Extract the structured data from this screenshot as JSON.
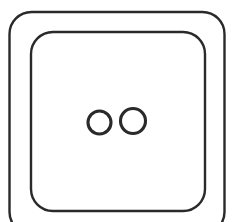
{
  "artwork": {
    "title": "Two-hole square button",
    "subject": "sewing-button",
    "style": "line-art-outline",
    "background_color": "#ffffff",
    "stroke_color": "#2a2a2a"
  },
  "canvas": {
    "width": 233,
    "height": 222
  },
  "shapes": {
    "outer_frame": {
      "name": "outer-rounded-square",
      "x": 9.5,
      "y": 12,
      "width": 215,
      "height": 222,
      "corner_radius": 22,
      "stroke_width": 2.4,
      "note": "cropped at bottom edge of canvas"
    },
    "inner_frame": {
      "name": "inner-rounded-square",
      "x": 31,
      "y": 32,
      "width": 174,
      "height": 179,
      "corner_radius": 22,
      "stroke_width": 2.4
    },
    "holes": [
      {
        "name": "left-hole",
        "cx": 99.5,
        "cy": 122.5,
        "r": 11.5,
        "stroke_width": 3.1
      },
      {
        "name": "right-hole",
        "cx": 133,
        "cy": 121,
        "r": 12.5,
        "stroke_width": 3.1
      }
    ]
  }
}
